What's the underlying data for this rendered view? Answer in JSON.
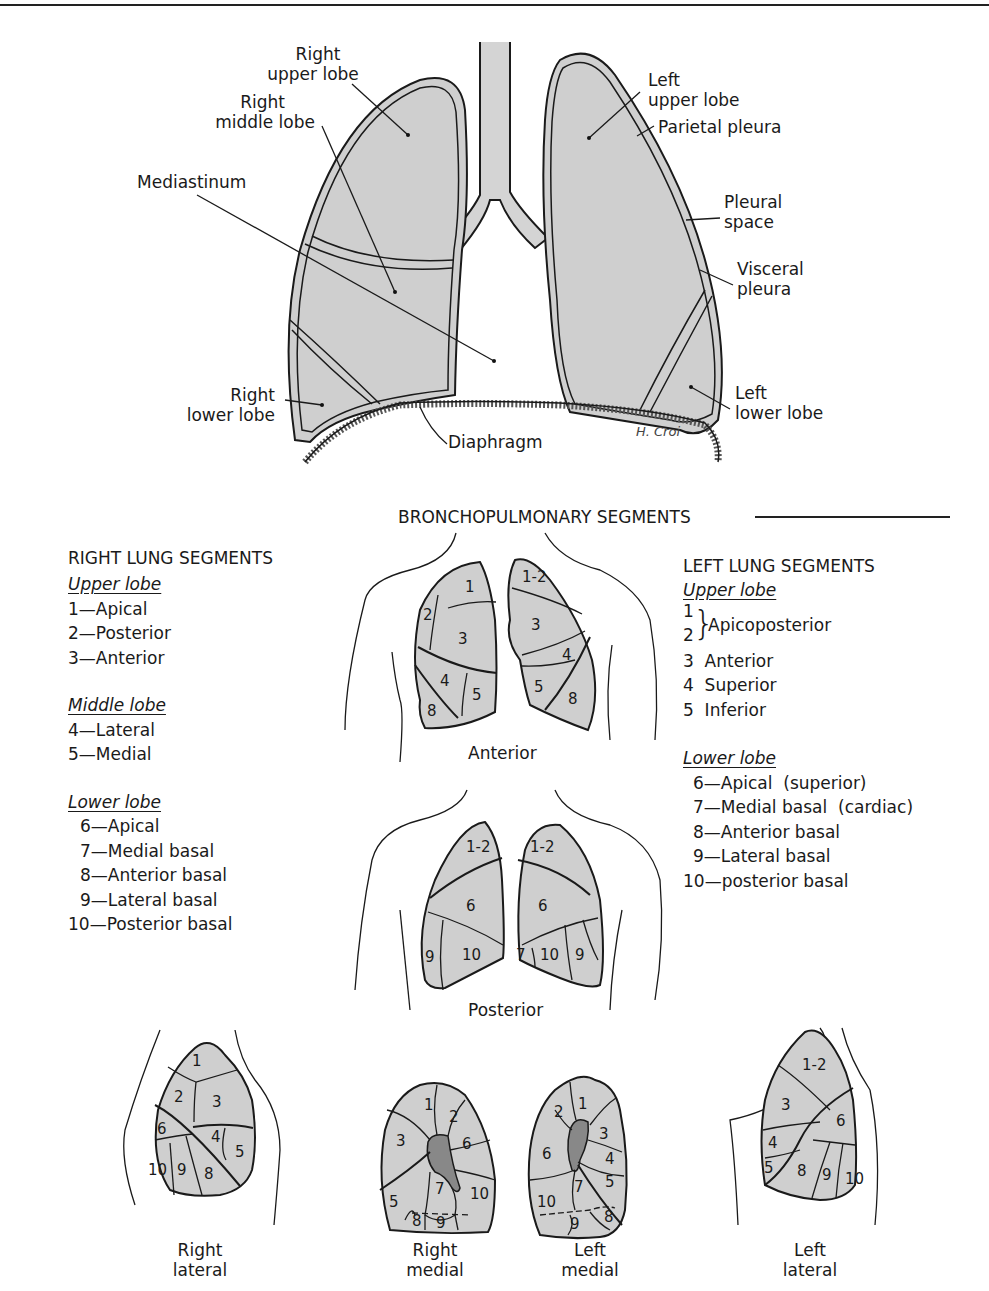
{
  "top_diagram": {
    "labels": {
      "right_upper_lobe": [
        "Right",
        "upper lobe"
      ],
      "right_middle_lobe": [
        "Right",
        "middle lobe"
      ],
      "mediastinum": "Mediastinum",
      "right_lower_lobe": [
        "Right",
        "lower lobe"
      ],
      "diaphragm": "Diaphragm",
      "left_upper_lobe": [
        "Left",
        "upper lobe"
      ],
      "parietal_pleura": "Parietal pleura",
      "pleural_space": [
        "Pleural",
        "space"
      ],
      "visceral_pleura": [
        "Visceral",
        "pleura"
      ],
      "left_lower_lobe": [
        "Left",
        "lower lobe"
      ],
      "signature": "H. Croi"
    }
  },
  "section_title": "BRONCHOPULMONARY SEGMENTS",
  "right_lung": {
    "heading": "RIGHT LUNG SEGMENTS",
    "groups": [
      {
        "title": "Upper lobe",
        "items": [
          "1—Apical",
          "2—Posterior",
          "3—Anterior"
        ]
      },
      {
        "title": "Middle lobe",
        "items": [
          "4—Lateral",
          "5—Medial"
        ]
      },
      {
        "title": "Lower lobe",
        "items": [
          "6—Apical",
          "7—Medial basal",
          "8—Anterior basal",
          "9—Lateral basal",
          "10—Posterior basal"
        ]
      }
    ]
  },
  "left_lung": {
    "heading": "LEFT LUNG SEGMENTS",
    "groups": [
      {
        "title": "Upper lobe",
        "items": [
          "1",
          "2",
          "Apicoposterior",
          "3  Anterior",
          "4  Superior",
          "5  Inferior"
        ]
      },
      {
        "title": "Lower lobe",
        "items": [
          "6—Apical  (superior)",
          "7—Medial basal  (cardiac)",
          "8—Anterior basal",
          "9—Lateral basal",
          "10—posterior basal"
        ]
      }
    ]
  },
  "views": {
    "anterior": {
      "caption": "Anterior",
      "right": [
        "1",
        "2",
        "3",
        "4",
        "5",
        "8"
      ],
      "left": [
        "1-2",
        "3",
        "4",
        "5",
        "8"
      ]
    },
    "posterior": {
      "caption": "Posterior",
      "right": [
        "1-2",
        "6",
        "9",
        "10"
      ],
      "left": [
        "1-2",
        "6",
        "7",
        "10",
        "9"
      ]
    },
    "right_lateral": {
      "caption": [
        "Right",
        "lateral"
      ],
      "segments": [
        "1",
        "2",
        "3",
        "6",
        "4",
        "5",
        "10",
        "9",
        "8"
      ]
    },
    "right_medial": {
      "caption": [
        "Right",
        "medial"
      ],
      "segments": [
        "1",
        "2",
        "3",
        "6",
        "7",
        "10",
        "5",
        "8",
        "9"
      ]
    },
    "left_medial": {
      "caption": [
        "Left",
        "medial"
      ],
      "segments": [
        "2",
        "1",
        "3",
        "6",
        "4",
        "5",
        "7",
        "10",
        "8",
        "9"
      ]
    },
    "left_lateral": {
      "caption": [
        "Left",
        "lateral"
      ],
      "segments": [
        "1-2",
        "3",
        "6",
        "4",
        "5",
        "8",
        "9",
        "10"
      ]
    }
  },
  "colors": {
    "lung_fill": "#cfcfcf",
    "line": "#1a1a1a",
    "background": "#ffffff"
  }
}
